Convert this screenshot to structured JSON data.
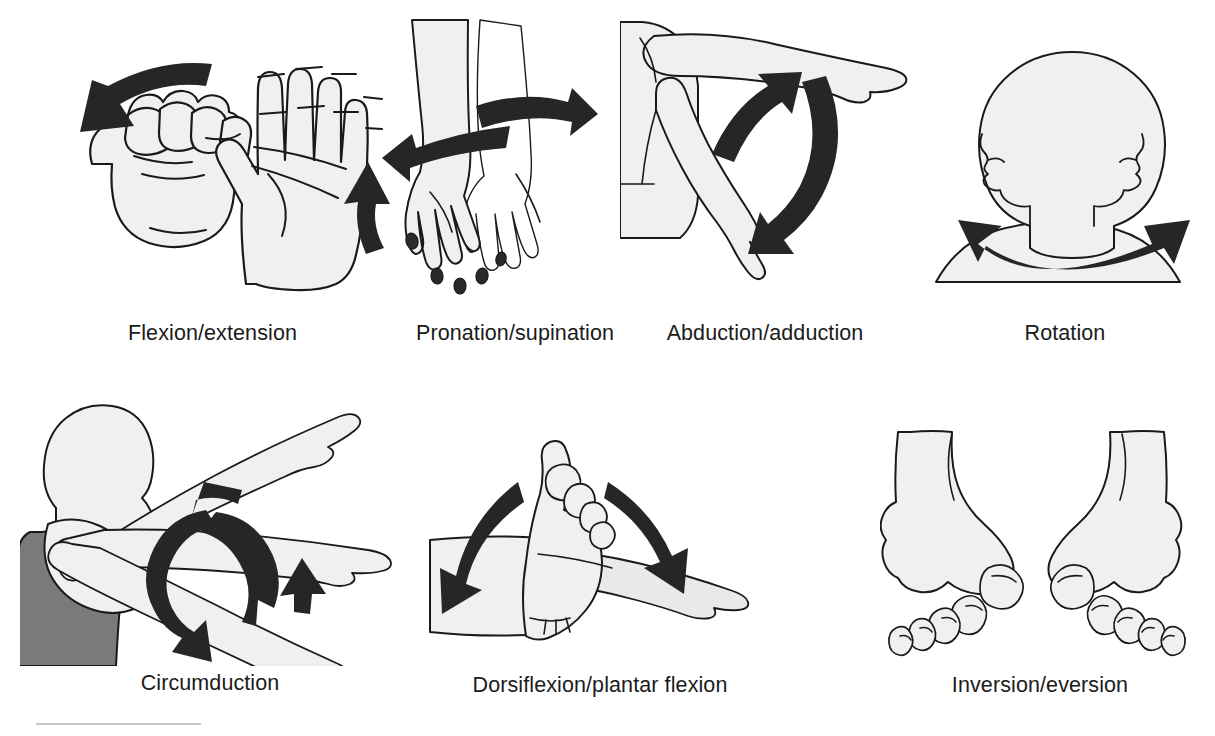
{
  "figure": {
    "background_color": "#ffffff",
    "line_color": "#1a1a1a",
    "skin_fill": "#f0f0f0",
    "shade_fill": "#e4e4e4",
    "arrow_color": "#262626",
    "shirt_color": "#7a7a7a",
    "rule_color": "#c9c9c9"
  },
  "panels": [
    {
      "id": "flexion-extension",
      "caption": "Flexion/extension",
      "subject": "hand",
      "icon": "fist-and-open-palm-illustration",
      "arrows": [
        "curved-arrow-left-down",
        "curved-arrow-up"
      ]
    },
    {
      "id": "pronation-supination",
      "caption": "Pronation/supination",
      "subject": "forearm-and-hands",
      "icon": "two-forearms-illustration",
      "arrows": [
        "curved-arrow-left",
        "curved-arrow-right"
      ]
    },
    {
      "id": "abduction-adduction",
      "caption": "Abduction/adduction",
      "subject": "shoulder-and-arm",
      "icon": "raised-and-lowered-arm-illustration",
      "arrows": [
        "curved-arrow-up",
        "curved-arrow-down"
      ]
    },
    {
      "id": "rotation",
      "caption": "Rotation",
      "subject": "head-and-neck",
      "icon": "head-turning-illustration",
      "arrows": [
        "double-headed-curved-arrow"
      ]
    },
    {
      "id": "circumduction",
      "caption": "Circumduction",
      "subject": "shoulder-and-arm",
      "icon": "arm-circling-illustration",
      "arrows": [
        "circular-loop-arrow"
      ]
    },
    {
      "id": "dorsiflexion-plantar-flexion",
      "caption": "Dorsiflexion/plantar flexion",
      "subject": "ankle-and-foot",
      "icon": "foot-two-positions-illustration",
      "arrows": [
        "curved-arrow-down-left",
        "curved-arrow-down-right"
      ]
    },
    {
      "id": "inversion-eversion",
      "caption": "Inversion/eversion",
      "subject": "both-feet",
      "icon": "two-feet-front-view-illustration",
      "arrows": []
    }
  ]
}
